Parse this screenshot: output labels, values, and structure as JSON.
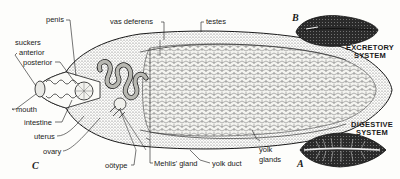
{
  "figure": {
    "panels": {
      "A": {
        "letter": "A",
        "caption_line1": "DIGESTIVE",
        "caption_line2": "SYSTEM"
      },
      "B": {
        "letter": "B",
        "caption_line1": "EXCRETORY",
        "caption_line2": "SYSTEM"
      },
      "C": {
        "letter": "C"
      }
    },
    "labels": {
      "penis": "penis",
      "vas_deferens": "vas deferens",
      "testes": "testes",
      "suckers": "suckers",
      "anterior": "anterior",
      "posterior": "posterior",
      "mouth": "mouth",
      "intestine": "intestine",
      "uterus": "uterus",
      "ovary": "ovary",
      "ootype": "oötype",
      "mehlis_gland": "Mehlis' gland",
      "yolk_duct": "yolk duct",
      "yolk_glands_line1": "yolk",
      "yolk_glands_line2": "glands"
    },
    "colors": {
      "ink": "#1a1a1a",
      "paper": "#fdfdfb",
      "stipple": "#777777"
    }
  }
}
